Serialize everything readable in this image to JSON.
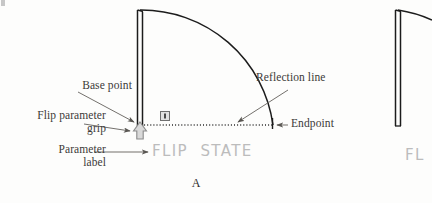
{
  "figure": {
    "caption": "A",
    "callouts": {
      "base_point": "Base point",
      "flip_parameter_grip": "Flip parameter\ngrip",
      "parameter_label": "Parameter\nlabel",
      "reflection_line": "Reflection line",
      "endpoint": "Endpoint"
    },
    "cad_labels": {
      "flip_state": "FLIP  STATE",
      "flip_state_partial": "FL"
    },
    "icons": {
      "flip_grip": "up-arrow-grip-icon",
      "alert_grip": "square-grip-marker-icon"
    },
    "colors": {
      "linework": "#1c1c1c",
      "callout_text": "#3c3a38",
      "leader_line": "#6b6864",
      "cad_label": "#bcbcbc",
      "grip_fill": "#d7d7d7",
      "grip_stroke": "#8d8d8d",
      "page_background": "#fdfdfc"
    },
    "geometry": {
      "door_hinge_x": 140,
      "door_top_y": 10,
      "door_base_y": 126,
      "arc_radius": 133,
      "arc_end_x": 273,
      "reflection_line_y": 125,
      "reflection_line_from_x": 141,
      "reflection_line_to_x": 272,
      "partial_figure_hinge_x": 398
    }
  }
}
